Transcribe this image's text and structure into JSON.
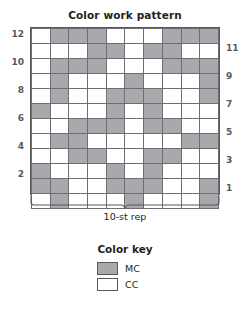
{
  "title": "Color work pattern",
  "repeat_label": "10-st rep",
  "colors": {
    "mc": "#a7a9ac",
    "cc": "#ffffff",
    "grid_line": "#6d6e71",
    "text": "#231f20",
    "number": "#58595b"
  },
  "key": {
    "title": "Color key",
    "entries": [
      {
        "symbol": "mc",
        "label": "MC"
      },
      {
        "symbol": "cc",
        "label": "CC"
      }
    ]
  },
  "row_numbers": {
    "left": [
      "12",
      "10",
      "8",
      "6",
      "4",
      "2"
    ],
    "right": [
      "11",
      "9",
      "7",
      "5",
      "3",
      "1"
    ]
  },
  "chart_data": {
    "type": "heatmap",
    "title": "Color work pattern",
    "xlabel": "10-st rep",
    "ylabel": "",
    "grid": true,
    "legend_position": "bottom",
    "stitch_count": 10,
    "row_count": 12,
    "value_legend": {
      "1": "MC",
      "0": "CC"
    },
    "row_labels_top_to_bottom": [
      12,
      11,
      10,
      9,
      8,
      7,
      6,
      5,
      4,
      3,
      2,
      1
    ],
    "column_labels": [
      1,
      2,
      3,
      4,
      5,
      6,
      7,
      8,
      9,
      10
    ],
    "rows_top_to_bottom": [
      {
        "row": 12,
        "cells": [
          0,
          1,
          1,
          1,
          0,
          0,
          0,
          1,
          1,
          1
        ]
      },
      {
        "row": 11,
        "cells": [
          0,
          0,
          0,
          1,
          1,
          0,
          1,
          1,
          0,
          0
        ]
      },
      {
        "row": 10,
        "cells": [
          0,
          1,
          1,
          1,
          0,
          0,
          0,
          1,
          1,
          1
        ]
      },
      {
        "row": 9,
        "cells": [
          0,
          1,
          0,
          0,
          0,
          1,
          0,
          0,
          0,
          1
        ]
      },
      {
        "row": 8,
        "cells": [
          0,
          1,
          0,
          0,
          1,
          1,
          1,
          0,
          0,
          1
        ]
      },
      {
        "row": 7,
        "cells": [
          1,
          0,
          0,
          0,
          1,
          0,
          1,
          0,
          0,
          0
        ]
      },
      {
        "row": 6,
        "cells": [
          0,
          0,
          1,
          1,
          1,
          0,
          1,
          1,
          0,
          0
        ]
      },
      {
        "row": 5,
        "cells": [
          0,
          1,
          1,
          0,
          0,
          0,
          0,
          0,
          1,
          1
        ]
      },
      {
        "row": 4,
        "cells": [
          0,
          0,
          1,
          1,
          0,
          0,
          1,
          1,
          0,
          0
        ]
      },
      {
        "row": 3,
        "cells": [
          1,
          0,
          0,
          0,
          1,
          0,
          1,
          0,
          0,
          0
        ]
      },
      {
        "row": 2,
        "cells": [
          1,
          1,
          0,
          0,
          1,
          1,
          1,
          0,
          0,
          1
        ]
      },
      {
        "row": 1,
        "cells": [
          0,
          1,
          0,
          0,
          0,
          1,
          0,
          0,
          0,
          1
        ]
      }
    ]
  }
}
